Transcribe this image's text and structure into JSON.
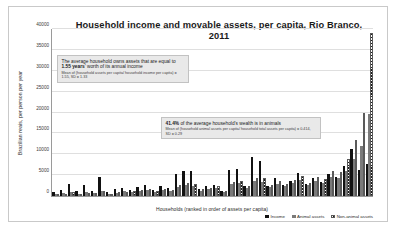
{
  "chart_data": {
    "type": "bar",
    "title": "Household income and movable assets, per capita, Rio Branco, 2011",
    "xlabel": "Households (ranked in order of assets per capita)",
    "ylabel": "Brazilian reais, per person per year",
    "ylim": [
      0,
      40000
    ],
    "yticks": [
      0,
      5000,
      10000,
      15000,
      20000,
      25000,
      30000,
      35000,
      40000
    ],
    "ytick_labels": [
      "0",
      "5000",
      "10000",
      "15000",
      "20000",
      "25000",
      "30000",
      "35000",
      "40000"
    ],
    "grid": true,
    "legend_position": "bottom-right",
    "categories": [
      "1",
      "2",
      "3",
      "4",
      "5",
      "6",
      "7",
      "8",
      "9",
      "10",
      "11",
      "12",
      "13",
      "14",
      "15",
      "16",
      "17",
      "18",
      "19",
      "20",
      "21",
      "22",
      "23",
      "24",
      "25",
      "26",
      "27",
      "28",
      "29",
      "30",
      "31",
      "32",
      "33",
      "34",
      "35",
      "36",
      "37",
      "38",
      "39",
      "40",
      "41",
      "42"
    ],
    "series": [
      {
        "name": "Income",
        "color": "#111111",
        "values": [
          900,
          1500,
          2900,
          1200,
          2700,
          1300,
          4600,
          900,
          1700,
          2000,
          1500,
          2200,
          2600,
          1400,
          2400,
          2000,
          5200,
          6000,
          5900,
          1800,
          2300,
          2600,
          1100,
          6200,
          6400,
          2400,
          9300,
          8300,
          2400,
          4200,
          2600,
          3500,
          5500,
          2800,
          4400,
          3300,
          5200,
          4600,
          7200,
          11300,
          6200,
          7600
        ]
      },
      {
        "name": "Animal assets",
        "color": "#7a7a7a",
        "values": [
          400,
          700,
          1000,
          600,
          900,
          800,
          1200,
          500,
          800,
          1100,
          900,
          1300,
          1400,
          1000,
          1500,
          1200,
          2100,
          2600,
          2300,
          1300,
          1700,
          2000,
          900,
          2800,
          3100,
          1900,
          3600,
          3400,
          2100,
          2900,
          2300,
          3000,
          3800,
          2600,
          3600,
          3100,
          4600,
          4300,
          6000,
          8800,
          11900,
          19700
        ]
      },
      {
        "name": "Non-animal assets",
        "color": "#e8e8e8",
        "pattern": "diagonal-hatch",
        "values": [
          300,
          600,
          900,
          500,
          800,
          700,
          1100,
          600,
          900,
          1000,
          1100,
          1400,
          1600,
          1200,
          1700,
          1500,
          2600,
          3000,
          2800,
          1600,
          2000,
          2400,
          1200,
          3300,
          3500,
          2300,
          4300,
          4200,
          2600,
          3600,
          2900,
          3800,
          4700,
          3200,
          4500,
          4000,
          6100,
          5800,
          8900,
          13300,
          19800,
          39000
        ]
      }
    ],
    "annotations": [
      {
        "id": "annotation-assets-years",
        "main_prefix": "The average household owns assets that are equal to ",
        "main_highlight": "1.55 years",
        "main_suffix": "’ worth of its annual income",
        "sub": "Mean of (household assets per capita/ household income per capita) = 1.55, SD = 1.33"
      },
      {
        "id": "annotation-wealth-animals",
        "main_prefix": "",
        "main_highlight": "41.4%",
        "main_suffix": " of the average household’s wealth is in animals",
        "sub": "Mean of (household animal assets per capita/ household total assets per capita) = 0.414, SD = 0.29"
      }
    ]
  }
}
